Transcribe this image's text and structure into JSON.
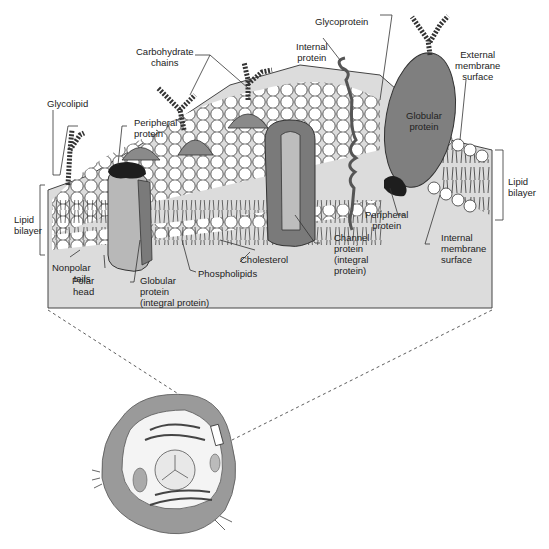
{
  "colors": {
    "background": "#ffffff",
    "block_face": "#dcdcdc",
    "protein_dark": "#7a7a7a",
    "protein_mid": "#9b9b9b",
    "protein_light": "#bdbdbd",
    "peripheral_black": "#1e1e1e",
    "head_fill": "#ffffff",
    "cell_membrane": "#9a9a9a",
    "line": "#333333"
  },
  "labels": {
    "carbohydrate_chains": "Carbohydrate\nchains",
    "glycolipid": "Glycolipid",
    "peripheral_protein_top": "Peripheral\nprotein",
    "glycoprotein": "Glycoprotein",
    "internal_protein": "Internal\nprotein",
    "external_membrane_surface": "External\nmembrane\nsurface",
    "globular_protein_right": "Globular\nprotein",
    "lipid_bilayer_left": "Lipid\nbilayer",
    "lipid_bilayer_right": "Lipid\nbilayer",
    "cholesterol": "Cholesterol",
    "peripheral_protein_bottom": "Peripheral\nprotein",
    "internal_membrane_surface": "Internal\nmembrane\nsurface",
    "nonpolar_tails": "Nonpolar\ntails",
    "polar_head": "Polar\nhead",
    "globular_protein_integral": "Globular\nprotein\n(integral protein)",
    "phospholipids": "Phospholipids",
    "channel_protein": "Channel\nprotein\n(integral\nprotein)"
  },
  "icons": {
    "cell": "animal-cell-illustration",
    "membrane": "membrane-block-illustration"
  }
}
